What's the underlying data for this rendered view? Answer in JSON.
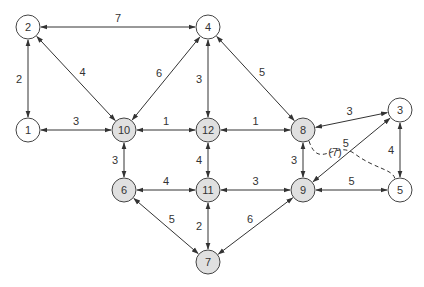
{
  "diagram": {
    "type": "network graph",
    "colors": {
      "edge": "#333333",
      "node_stroke": "#444444",
      "node_fill_plain": "#ffffff",
      "node_fill_highlight": "#e0e0e0",
      "text": "#333333"
    },
    "nodes": [
      {
        "id": "2",
        "label": "2",
        "x": 28,
        "y": 27,
        "highlight": false
      },
      {
        "id": "4",
        "label": "4",
        "x": 208,
        "y": 27,
        "highlight": false
      },
      {
        "id": "1",
        "label": "1",
        "x": 28,
        "y": 130,
        "highlight": false
      },
      {
        "id": "10",
        "label": "10",
        "x": 124,
        "y": 130,
        "highlight": true
      },
      {
        "id": "12",
        "label": "12",
        "x": 208,
        "y": 130,
        "highlight": true
      },
      {
        "id": "8",
        "label": "8",
        "x": 303,
        "y": 130,
        "highlight": true
      },
      {
        "id": "3",
        "label": "3",
        "x": 400,
        "y": 110,
        "highlight": false
      },
      {
        "id": "6",
        "label": "6",
        "x": 124,
        "y": 190,
        "highlight": true
      },
      {
        "id": "11",
        "label": "11",
        "x": 208,
        "y": 190,
        "highlight": true
      },
      {
        "id": "9",
        "label": "9",
        "x": 303,
        "y": 190,
        "highlight": true
      },
      {
        "id": "5",
        "label": "5",
        "x": 400,
        "y": 190,
        "highlight": false
      },
      {
        "id": "7",
        "label": "7",
        "x": 208,
        "y": 262,
        "highlight": true
      }
    ],
    "edges": [
      {
        "from": "2",
        "to": "4",
        "weight": "7"
      },
      {
        "from": "2",
        "to": "1",
        "weight": "2"
      },
      {
        "from": "2",
        "to": "10",
        "weight": "4"
      },
      {
        "from": "4",
        "to": "10",
        "weight": "6"
      },
      {
        "from": "4",
        "to": "12",
        "weight": "3"
      },
      {
        "from": "4",
        "to": "8",
        "weight": "5"
      },
      {
        "from": "1",
        "to": "10",
        "weight": "3"
      },
      {
        "from": "10",
        "to": "12",
        "weight": "1"
      },
      {
        "from": "12",
        "to": "8",
        "weight": "1"
      },
      {
        "from": "8",
        "to": "3",
        "weight": "3"
      },
      {
        "from": "10",
        "to": "6",
        "weight": "3"
      },
      {
        "from": "12",
        "to": "11",
        "weight": "4"
      },
      {
        "from": "8",
        "to": "9",
        "weight": "3"
      },
      {
        "from": "3",
        "to": "9",
        "weight": "5"
      },
      {
        "from": "3",
        "to": "5",
        "weight": "4"
      },
      {
        "from": "6",
        "to": "11",
        "weight": "4"
      },
      {
        "from": "11",
        "to": "9",
        "weight": "3"
      },
      {
        "from": "9",
        "to": "5",
        "weight": "5"
      },
      {
        "from": "6",
        "to": "7",
        "weight": "5"
      },
      {
        "from": "11",
        "to": "7",
        "weight": "2"
      },
      {
        "from": "9",
        "to": "7",
        "weight": "6"
      }
    ],
    "dashed_edges": [
      {
        "from": "8",
        "to": "5",
        "weight": "(7)"
      }
    ]
  }
}
